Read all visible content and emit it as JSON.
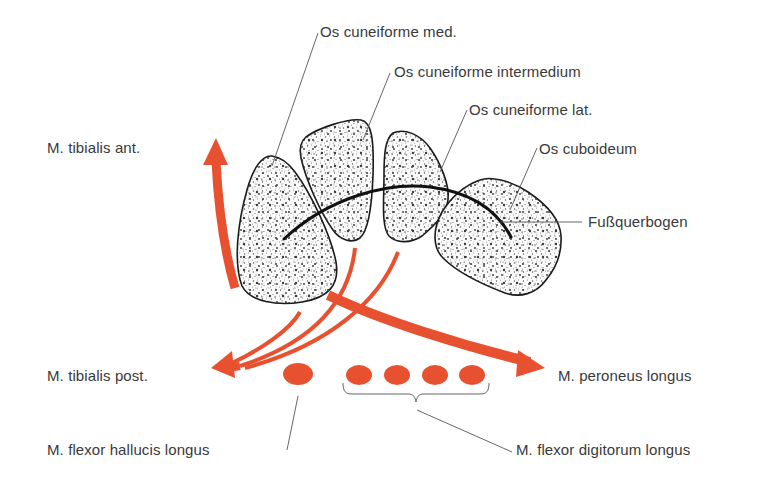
{
  "diagram": {
    "type": "anatomical cross-section",
    "colors": {
      "muscle": "#e8512f",
      "bone_outline": "#1a1a1a",
      "leader_line": "#555555",
      "text": "#3a3a3a",
      "background": "#ffffff"
    },
    "bones": [
      {
        "id": "cuneiforme-med",
        "label": "Os cuneiforme med."
      },
      {
        "id": "cuneiforme-intermedium",
        "label": "Os cuneiforme intermedium"
      },
      {
        "id": "cuneiforme-lat",
        "label": "Os cuneiforme lat."
      },
      {
        "id": "cuboideum",
        "label": "Os cuboideum"
      }
    ],
    "arch": {
      "label": "Fußquerbogen"
    },
    "muscles": [
      {
        "id": "tibialis-ant",
        "label": "M. tibialis ant."
      },
      {
        "id": "tibialis-post",
        "label": "M. tibialis post."
      },
      {
        "id": "peroneus-longus",
        "label": "M. peroneus longus"
      },
      {
        "id": "flexor-hallucis-longus",
        "label": "M. flexor hallucis longus"
      },
      {
        "id": "flexor-digitorum-longus",
        "label": "M. flexor digitorum longus"
      }
    ]
  }
}
